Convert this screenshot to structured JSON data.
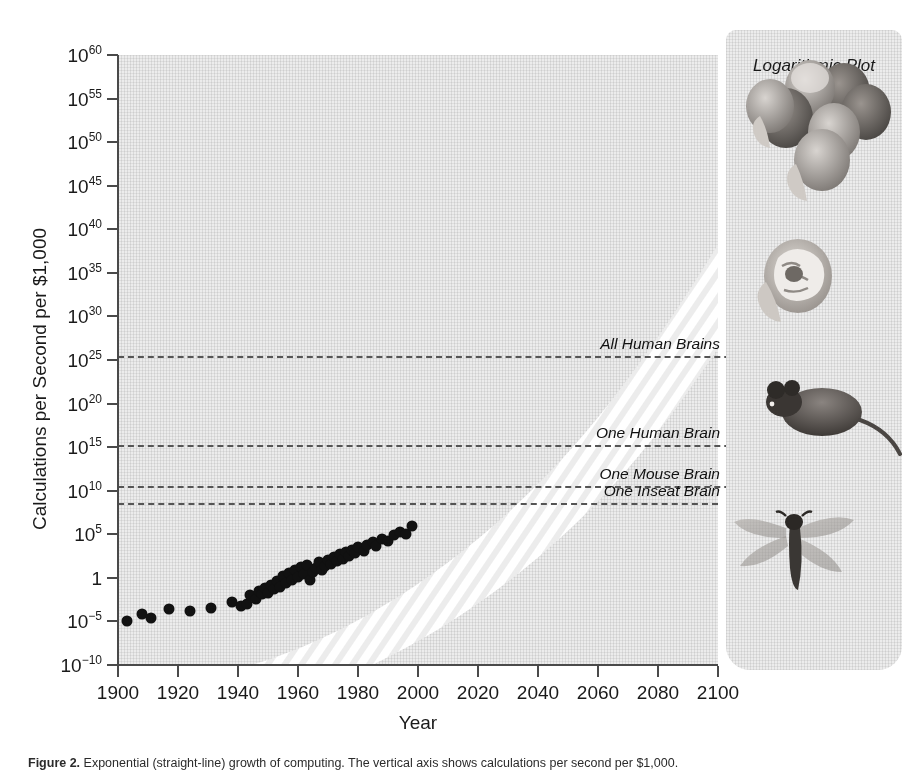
{
  "panel": {
    "title": "Logarithmic Plot"
  },
  "caption": {
    "label": "Figure 2.",
    "text": "Exponential (straight-line) growth of computing. The vertical axis shows calculations per second per $1,000."
  },
  "chart_data": {
    "type": "scatter",
    "title": "Logarithmic Plot",
    "xlabel": "Year",
    "ylabel": "Calculations per Second per $1,000",
    "xlim": [
      1900,
      2100
    ],
    "ylim": [
      -10,
      60
    ],
    "y_scale": "log10",
    "grid": false,
    "legend_position": "none",
    "xticks": [
      "1900",
      "1920",
      "1940",
      "1960",
      "1980",
      "2000",
      "2020",
      "2040",
      "2060",
      "2080",
      "2100"
    ],
    "xtick_values": [
      1900,
      1920,
      1940,
      1960,
      1980,
      2000,
      2020,
      2040,
      2060,
      2080,
      2100
    ],
    "yticks": [
      {
        "mantissa": "10",
        "exponent": "60",
        "value": 60
      },
      {
        "mantissa": "10",
        "exponent": "55",
        "value": 55
      },
      {
        "mantissa": "10",
        "exponent": "50",
        "value": 50
      },
      {
        "mantissa": "10",
        "exponent": "45",
        "value": 45
      },
      {
        "mantissa": "10",
        "exponent": "40",
        "value": 40
      },
      {
        "mantissa": "10",
        "exponent": "35",
        "value": 35
      },
      {
        "mantissa": "10",
        "exponent": "30",
        "value": 30
      },
      {
        "mantissa": "10",
        "exponent": "25",
        "value": 25
      },
      {
        "mantissa": "10",
        "exponent": "20",
        "value": 20
      },
      {
        "mantissa": "10",
        "exponent": "15",
        "value": 15
      },
      {
        "mantissa": "10",
        "exponent": "10",
        "value": 10
      },
      {
        "mantissa": "10",
        "exponent": "5",
        "value": 5
      },
      {
        "mantissa": "1",
        "exponent": "",
        "value": 0
      },
      {
        "mantissa": "10",
        "exponent": "−5",
        "value": -5
      },
      {
        "mantissa": "10",
        "exponent": "−10",
        "value": -10
      }
    ],
    "thresholds": [
      {
        "label": "All Human Brains",
        "log_value": 25.5
      },
      {
        "label": "One Human Brain",
        "log_value": 15.2
      },
      {
        "label": "One Mouse Brain",
        "log_value": 10.5
      },
      {
        "label": "One Inseat Brain",
        "log_value": 8.6
      }
    ],
    "trend_band": {
      "description": "white diagonal striped exponential growth band",
      "start": {
        "x": 1900,
        "log_y": -6.5
      },
      "end": {
        "x": 2098,
        "log_y": 60
      }
    },
    "points": [
      {
        "x": 1903,
        "log_y": -5.0
      },
      {
        "x": 1908,
        "log_y": -4.2
      },
      {
        "x": 1911,
        "log_y": -4.6
      },
      {
        "x": 1917,
        "log_y": -3.6
      },
      {
        "x": 1924,
        "log_y": -3.8
      },
      {
        "x": 1931,
        "log_y": -3.5
      },
      {
        "x": 1938,
        "log_y": -2.8
      },
      {
        "x": 1941,
        "log_y": -3.2
      },
      {
        "x": 1943,
        "log_y": -3.0
      },
      {
        "x": 1944,
        "log_y": -2.0
      },
      {
        "x": 1946,
        "log_y": -2.4
      },
      {
        "x": 1947,
        "log_y": -1.5
      },
      {
        "x": 1948,
        "log_y": -1.9
      },
      {
        "x": 1949,
        "log_y": -1.2
      },
      {
        "x": 1950,
        "log_y": -1.7
      },
      {
        "x": 1951,
        "log_y": -0.8
      },
      {
        "x": 1952,
        "log_y": -1.3
      },
      {
        "x": 1953,
        "log_y": -0.4
      },
      {
        "x": 1954,
        "log_y": -1.0
      },
      {
        "x": 1955,
        "log_y": 0.2
      },
      {
        "x": 1956,
        "log_y": -0.6
      },
      {
        "x": 1957,
        "log_y": 0.6
      },
      {
        "x": 1958,
        "log_y": -0.2
      },
      {
        "x": 1959,
        "log_y": 0.9
      },
      {
        "x": 1960,
        "log_y": 0.1
      },
      {
        "x": 1961,
        "log_y": 1.2
      },
      {
        "x": 1962,
        "log_y": 0.4
      },
      {
        "x": 1963,
        "log_y": 1.5
      },
      {
        "x": 1964,
        "log_y": -0.3
      },
      {
        "x": 1965,
        "log_y": 0.7
      },
      {
        "x": 1966,
        "log_y": 1.1
      },
      {
        "x": 1967,
        "log_y": 1.8
      },
      {
        "x": 1968,
        "log_y": 0.9
      },
      {
        "x": 1969,
        "log_y": 1.4
      },
      {
        "x": 1970,
        "log_y": 2.1
      },
      {
        "x": 1971,
        "log_y": 1.6
      },
      {
        "x": 1972,
        "log_y": 2.4
      },
      {
        "x": 1973,
        "log_y": 1.9
      },
      {
        "x": 1974,
        "log_y": 2.7
      },
      {
        "x": 1975,
        "log_y": 2.2
      },
      {
        "x": 1976,
        "log_y": 3.0
      },
      {
        "x": 1977,
        "log_y": 2.5
      },
      {
        "x": 1978,
        "log_y": 3.2
      },
      {
        "x": 1979,
        "log_y": 2.9
      },
      {
        "x": 1980,
        "log_y": 3.5
      },
      {
        "x": 1982,
        "log_y": 3.1
      },
      {
        "x": 1983,
        "log_y": 3.8
      },
      {
        "x": 1985,
        "log_y": 4.1
      },
      {
        "x": 1986,
        "log_y": 3.6
      },
      {
        "x": 1988,
        "log_y": 4.5
      },
      {
        "x": 1990,
        "log_y": 4.2
      },
      {
        "x": 1992,
        "log_y": 4.9
      },
      {
        "x": 1994,
        "log_y": 5.3
      },
      {
        "x": 1996,
        "log_y": 5.0
      },
      {
        "x": 1998,
        "log_y": 5.9
      }
    ]
  },
  "illustrations": [
    {
      "name": "human-heads-group",
      "label": "All Human Brains"
    },
    {
      "name": "human-head-brain",
      "label": "One Human Brain"
    },
    {
      "name": "mouse",
      "label": "One Mouse Brain"
    },
    {
      "name": "dragonfly",
      "label": "One Inseat Brain"
    }
  ]
}
